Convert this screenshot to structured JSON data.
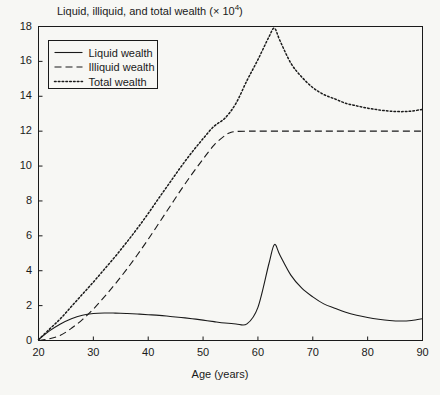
{
  "chart_data": {
    "type": "line",
    "title_main": "Liquid, illiquid, and total wealth (× 10",
    "title_sup": "4",
    "title_tail": ")",
    "xlabel": "Age (years)",
    "ylabel": "",
    "xlim": [
      20,
      90
    ],
    "ylim": [
      0,
      18
    ],
    "xticks": [
      20,
      30,
      40,
      50,
      60,
      70,
      80,
      90
    ],
    "yticks": [
      0,
      2,
      4,
      6,
      8,
      10,
      12,
      14,
      16,
      18
    ],
    "grid": false,
    "legend_position": "upper-left",
    "line_color": "#1a1a1a",
    "background_color": "#f7f7f4",
    "series": [
      {
        "name": "Liquid wealth",
        "style": "solid",
        "x": [
          20,
          22,
          24,
          26,
          28,
          30,
          32,
          34,
          36,
          38,
          40,
          42,
          44,
          46,
          48,
          50,
          52,
          54,
          56,
          58,
          60,
          62,
          63,
          64,
          66,
          68,
          70,
          72,
          74,
          76,
          78,
          80,
          82,
          84,
          86,
          88,
          90
        ],
        "values": [
          0.05,
          0.55,
          0.95,
          1.25,
          1.45,
          1.55,
          1.58,
          1.57,
          1.55,
          1.52,
          1.48,
          1.44,
          1.38,
          1.32,
          1.25,
          1.17,
          1.08,
          1.0,
          0.95,
          0.95,
          1.9,
          4.4,
          5.5,
          4.9,
          3.75,
          3.0,
          2.5,
          2.1,
          1.85,
          1.62,
          1.45,
          1.32,
          1.22,
          1.15,
          1.12,
          1.15,
          1.25
        ]
      },
      {
        "name": "Illiquid wealth",
        "style": "dashed",
        "x": [
          20,
          22,
          24,
          26,
          28,
          30,
          32,
          34,
          36,
          38,
          40,
          42,
          44,
          46,
          48,
          50,
          52,
          54,
          55,
          56,
          58,
          60,
          65,
          70,
          75,
          80,
          85,
          90
        ],
        "values": [
          0.0,
          0.1,
          0.3,
          0.7,
          1.2,
          1.8,
          2.5,
          3.25,
          4.05,
          4.9,
          5.8,
          6.75,
          7.7,
          8.65,
          9.55,
          10.4,
          11.2,
          11.75,
          11.92,
          11.98,
          12.0,
          12.0,
          12.0,
          12.0,
          12.0,
          12.0,
          12.0,
          12.0
        ]
      },
      {
        "name": "Total wealth",
        "style": "dotted",
        "x": [
          20,
          22,
          24,
          26,
          28,
          30,
          32,
          34,
          36,
          38,
          40,
          42,
          44,
          46,
          48,
          50,
          52,
          54,
          56,
          58,
          60,
          62,
          63,
          64,
          66,
          68,
          70,
          72,
          74,
          76,
          78,
          80,
          82,
          84,
          86,
          88,
          90
        ],
        "values": [
          0.05,
          0.65,
          1.25,
          1.95,
          2.65,
          3.35,
          4.08,
          4.82,
          5.6,
          6.42,
          7.28,
          8.19,
          9.08,
          9.97,
          10.8,
          11.57,
          12.28,
          12.75,
          13.6,
          14.9,
          16.1,
          17.4,
          17.9,
          17.2,
          15.9,
          15.1,
          14.5,
          14.1,
          13.85,
          13.6,
          13.45,
          13.32,
          13.22,
          13.15,
          13.12,
          13.15,
          13.25
        ]
      }
    ]
  },
  "legend": {
    "items": [
      {
        "label": "Liquid wealth",
        "style": "solid"
      },
      {
        "label": "Illiquid wealth",
        "style": "dashed"
      },
      {
        "label": "Total wealth",
        "style": "dotted"
      }
    ]
  },
  "axes": {
    "y_tick_labels": [
      "18",
      "16",
      "14",
      "12",
      "10",
      "8",
      "6",
      "4",
      "2",
      "0"
    ],
    "x_tick_labels": [
      "20",
      "30",
      "40",
      "50",
      "60",
      "70",
      "80",
      "90"
    ]
  }
}
